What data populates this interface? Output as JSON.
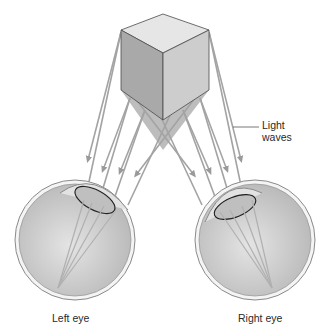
{
  "diagram": {
    "labels": {
      "light_waves_line1": "Light",
      "light_waves_line2": "waves",
      "left_eye": "Left eye",
      "right_eye": "Right eye"
    },
    "colors": {
      "cube_top": "#e6e6e6",
      "cube_left": "#a9a9a9",
      "cube_right": "#cdcdcd",
      "shadow": "#bdbdbd",
      "ray": "#a3a3a3",
      "eyeball": "#d2d2d2",
      "outline": "#555555"
    }
  }
}
